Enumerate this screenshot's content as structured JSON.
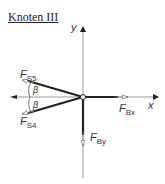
{
  "title": "Knoten III",
  "axes": {
    "x_label": "x",
    "y_label": "y"
  },
  "forces": [
    {
      "name": "F",
      "sub": "S5",
      "direction": "up-left"
    },
    {
      "name": "F",
      "sub": "S4",
      "direction": "down-left"
    },
    {
      "name": "F",
      "sub": "Bx",
      "direction": "right"
    },
    {
      "name": "F",
      "sub": "By",
      "direction": "down"
    }
  ],
  "angles": [
    {
      "label": "β"
    },
    {
      "label": "β"
    }
  ],
  "colors": {
    "member": "#222222",
    "axis": "#999999",
    "text": "#333333"
  }
}
